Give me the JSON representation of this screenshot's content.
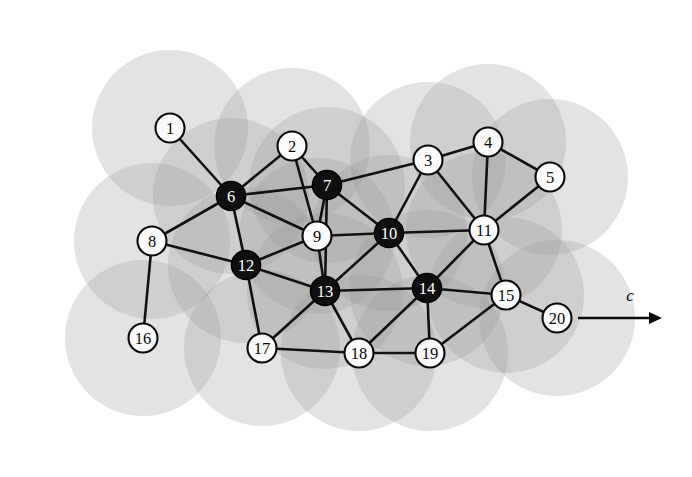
{
  "figure": {
    "name": "wireless-sensor-network-coverage-graph",
    "width": 692,
    "height": 477,
    "background_color": "#ffffff"
  },
  "style": {
    "coverage_disc_color": "#9a9a9a",
    "coverage_disc_opacity": 0.28,
    "coverage_disc_radius": 78,
    "edge_color": "#111111",
    "edge_width": 2.6,
    "node_radius": 14.5,
    "dark_node_fill": "#100f10",
    "dark_node_label_color": "#ffffff",
    "light_node_fill": "#fbfbfb",
    "light_node_label_color": "#0a0a0a",
    "node_stroke_color": "#0a0a0a"
  },
  "direction_indicator": {
    "label": "c",
    "name": "direction-vector-c",
    "line_x1": 578,
    "line_y1": 318,
    "line_x2": 662,
    "line_y2": 318,
    "label_x": 630,
    "label_y": 295
  },
  "graph": {
    "node_count": 20,
    "edge_count": 40,
    "nodes": [
      {
        "id": 1,
        "label": "1",
        "x": 170,
        "y": 128,
        "fill": "light"
      },
      {
        "id": 2,
        "label": "2",
        "x": 292,
        "y": 146,
        "fill": "light"
      },
      {
        "id": 3,
        "label": "3",
        "x": 428,
        "y": 160,
        "fill": "light"
      },
      {
        "id": 4,
        "label": "4",
        "x": 488,
        "y": 142,
        "fill": "light"
      },
      {
        "id": 5,
        "label": "5",
        "x": 550,
        "y": 177,
        "fill": "light"
      },
      {
        "id": 6,
        "label": "6",
        "x": 231,
        "y": 196,
        "fill": "dark"
      },
      {
        "id": 7,
        "label": "7",
        "x": 327,
        "y": 185,
        "fill": "dark"
      },
      {
        "id": 8,
        "label": "8",
        "x": 152,
        "y": 241,
        "fill": "light"
      },
      {
        "id": 9,
        "label": "9",
        "x": 317,
        "y": 236,
        "fill": "light"
      },
      {
        "id": 10,
        "label": "10",
        "x": 389,
        "y": 233,
        "fill": "dark"
      },
      {
        "id": 11,
        "label": "11",
        "x": 484,
        "y": 230,
        "fill": "light"
      },
      {
        "id": 12,
        "label": "12",
        "x": 246,
        "y": 265,
        "fill": "dark"
      },
      {
        "id": 13,
        "label": "13",
        "x": 325,
        "y": 291,
        "fill": "dark"
      },
      {
        "id": 14,
        "label": "14",
        "x": 427,
        "y": 288,
        "fill": "dark"
      },
      {
        "id": 15,
        "label": "15",
        "x": 506,
        "y": 295,
        "fill": "light"
      },
      {
        "id": 16,
        "label": "16",
        "x": 143,
        "y": 338,
        "fill": "light"
      },
      {
        "id": 17,
        "label": "17",
        "x": 262,
        "y": 348,
        "fill": "light"
      },
      {
        "id": 18,
        "label": "18",
        "x": 359,
        "y": 353,
        "fill": "light"
      },
      {
        "id": 19,
        "label": "19",
        "x": 430,
        "y": 353,
        "fill": "light"
      },
      {
        "id": 20,
        "label": "20",
        "x": 557,
        "y": 318,
        "fill": "light"
      }
    ],
    "edges": [
      {
        "from": 1,
        "to": 6
      },
      {
        "from": 2,
        "to": 6
      },
      {
        "from": 2,
        "to": 7
      },
      {
        "from": 2,
        "to": 9
      },
      {
        "from": 3,
        "to": 4
      },
      {
        "from": 3,
        "to": 7
      },
      {
        "from": 3,
        "to": 10
      },
      {
        "from": 3,
        "to": 11
      },
      {
        "from": 4,
        "to": 5
      },
      {
        "from": 4,
        "to": 11
      },
      {
        "from": 5,
        "to": 11
      },
      {
        "from": 6,
        "to": 7
      },
      {
        "from": 6,
        "to": 8
      },
      {
        "from": 6,
        "to": 9
      },
      {
        "from": 6,
        "to": 12
      },
      {
        "from": 7,
        "to": 9
      },
      {
        "from": 7,
        "to": 10
      },
      {
        "from": 7,
        "to": 13
      },
      {
        "from": 8,
        "to": 12
      },
      {
        "from": 8,
        "to": 16
      },
      {
        "from": 9,
        "to": 10
      },
      {
        "from": 9,
        "to": 12
      },
      {
        "from": 9,
        "to": 13
      },
      {
        "from": 10,
        "to": 11
      },
      {
        "from": 10,
        "to": 13
      },
      {
        "from": 10,
        "to": 14
      },
      {
        "from": 11,
        "to": 14
      },
      {
        "from": 11,
        "to": 15
      },
      {
        "from": 12,
        "to": 13
      },
      {
        "from": 12,
        "to": 17
      },
      {
        "from": 13,
        "to": 14
      },
      {
        "from": 13,
        "to": 17
      },
      {
        "from": 13,
        "to": 18
      },
      {
        "from": 14,
        "to": 15
      },
      {
        "from": 14,
        "to": 18
      },
      {
        "from": 14,
        "to": 19
      },
      {
        "from": 15,
        "to": 19
      },
      {
        "from": 15,
        "to": 20
      },
      {
        "from": 17,
        "to": 18
      },
      {
        "from": 18,
        "to": 19
      }
    ],
    "coverage_discs": [
      {
        "cx": 170,
        "cy": 128
      },
      {
        "cx": 292,
        "cy": 146
      },
      {
        "cx": 428,
        "cy": 160
      },
      {
        "cx": 488,
        "cy": 142
      },
      {
        "cx": 550,
        "cy": 177
      },
      {
        "cx": 231,
        "cy": 196
      },
      {
        "cx": 327,
        "cy": 185
      },
      {
        "cx": 152,
        "cy": 241
      },
      {
        "cx": 317,
        "cy": 236
      },
      {
        "cx": 389,
        "cy": 233
      },
      {
        "cx": 484,
        "cy": 230
      },
      {
        "cx": 246,
        "cy": 265
      },
      {
        "cx": 325,
        "cy": 291
      },
      {
        "cx": 427,
        "cy": 288
      },
      {
        "cx": 506,
        "cy": 295
      },
      {
        "cx": 143,
        "cy": 338
      },
      {
        "cx": 262,
        "cy": 348
      },
      {
        "cx": 359,
        "cy": 353
      },
      {
        "cx": 430,
        "cy": 353
      },
      {
        "cx": 557,
        "cy": 318
      }
    ]
  }
}
